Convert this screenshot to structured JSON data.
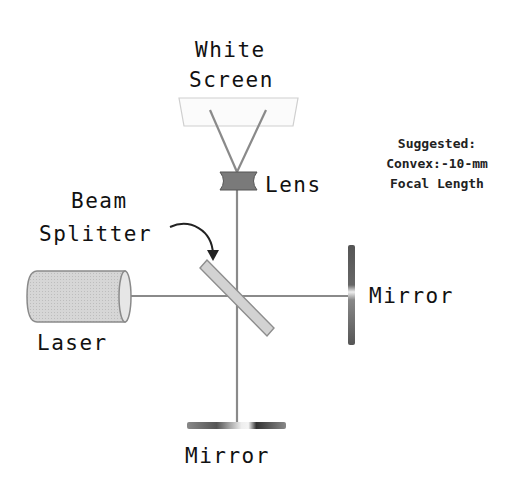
{
  "diagram": {
    "type": "Michelson interferometer setup",
    "labels": {
      "screen_line1": "White",
      "screen_line2": "Screen",
      "lens": "Lens",
      "splitter_line1": "Beam",
      "splitter_line2": "Splitter",
      "laser": "Laser",
      "mirror_right": "Mirror",
      "mirror_bottom": "Mirror"
    },
    "note": {
      "line1": "Suggested:",
      "line2": "Convex:-10-mm",
      "line3": "Focal Length"
    },
    "colors": {
      "beam": "#8a8a8a",
      "component_fill": "#d0d0d0",
      "mirror_dark": "#444444",
      "text": "#111111"
    }
  }
}
